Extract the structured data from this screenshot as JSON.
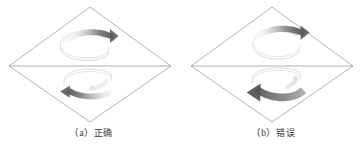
{
  "figure": {
    "background_color": "#ffffff",
    "outline_color": "#9a9a9a",
    "arrow_dark_color": "#5e5e5e",
    "arrow_light_color": "#f2f2f2",
    "caption_color": "#3a3a3a",
    "panels": [
      {
        "id": "a",
        "label": "（a）",
        "caption": "正确",
        "shape": "rhombus-with-horizontal-midline",
        "arrows": [
          {
            "position": "top",
            "name": "rotation-arrow-top-correct",
            "direction": "counterclockwise-head-right",
            "head_points": "right"
          },
          {
            "position": "bottom",
            "name": "rotation-arrow-bottom-correct",
            "direction": "counterclockwise-head-left",
            "head_points": "left"
          }
        ]
      },
      {
        "id": "b",
        "label": "（b）",
        "caption": "错误",
        "shape": "rhombus-with-horizontal-midline",
        "arrows": [
          {
            "position": "top",
            "name": "rotation-arrow-top-incorrect",
            "direction": "clockwise-head-right",
            "head_points": "right"
          },
          {
            "position": "bottom",
            "name": "rotation-arrow-bottom-incorrect",
            "direction": "clockwise-head-left",
            "head_points": "left"
          }
        ]
      }
    ]
  }
}
